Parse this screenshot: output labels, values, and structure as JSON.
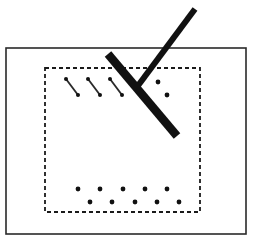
{
  "figure": {
    "canvas": {
      "width": 259,
      "height": 243,
      "background": "#ffffff"
    },
    "colors": {
      "stroke": "#2a2a2a",
      "bar": "#111111",
      "dot": "#111111",
      "dashed": "#1a1a1a",
      "background": "#ffffff"
    },
    "outer_frame": {
      "label": "outer solid rectangle",
      "x": 6,
      "y": 48,
      "width": 240,
      "height": 186,
      "stroke_width": 1.6,
      "style": "solid"
    },
    "inner_region": {
      "label": "inner dashed rectangle",
      "x": 45,
      "y": 68,
      "width": 155,
      "height": 144,
      "stroke_width": 1.8,
      "style": "dashed",
      "dash_pattern": "4 3"
    },
    "primary_bar": {
      "label": "thick scratch bar",
      "x1": 108,
      "y1": 54,
      "x2": 177,
      "y2": 136,
      "stroke_width": 8.5
    },
    "secondary_bar": {
      "label": "thin indenter arm",
      "x1": 195,
      "y1": 9,
      "x2": 137,
      "y2": 87,
      "stroke_width": 6.0
    },
    "tick_marks": {
      "label": "short diagonal crack marks",
      "stroke_width": 1.8,
      "end_dot_radius": 2.0,
      "items": [
        {
          "x1": 66,
          "y1": 79,
          "x2": 78,
          "y2": 95
        },
        {
          "x1": 88,
          "y1": 79,
          "x2": 100,
          "y2": 95
        },
        {
          "x1": 110,
          "y1": 79,
          "x2": 122,
          "y2": 95
        }
      ]
    },
    "side_dots": {
      "label": "isolated debris dots right of bar",
      "radius": 2.4,
      "items": [
        {
          "x": 158,
          "y": 82
        },
        {
          "x": 167,
          "y": 95
        }
      ]
    },
    "dot_rows": {
      "label": "two staggered rows of debris dots",
      "radius": 2.4,
      "rows": [
        {
          "name": "upper-dot-row",
          "y": 189,
          "x": [
            78,
            100,
            123,
            145,
            167
          ]
        },
        {
          "name": "lower-dot-row",
          "y": 202,
          "x": [
            90,
            112,
            135,
            157,
            179
          ]
        }
      ]
    }
  }
}
